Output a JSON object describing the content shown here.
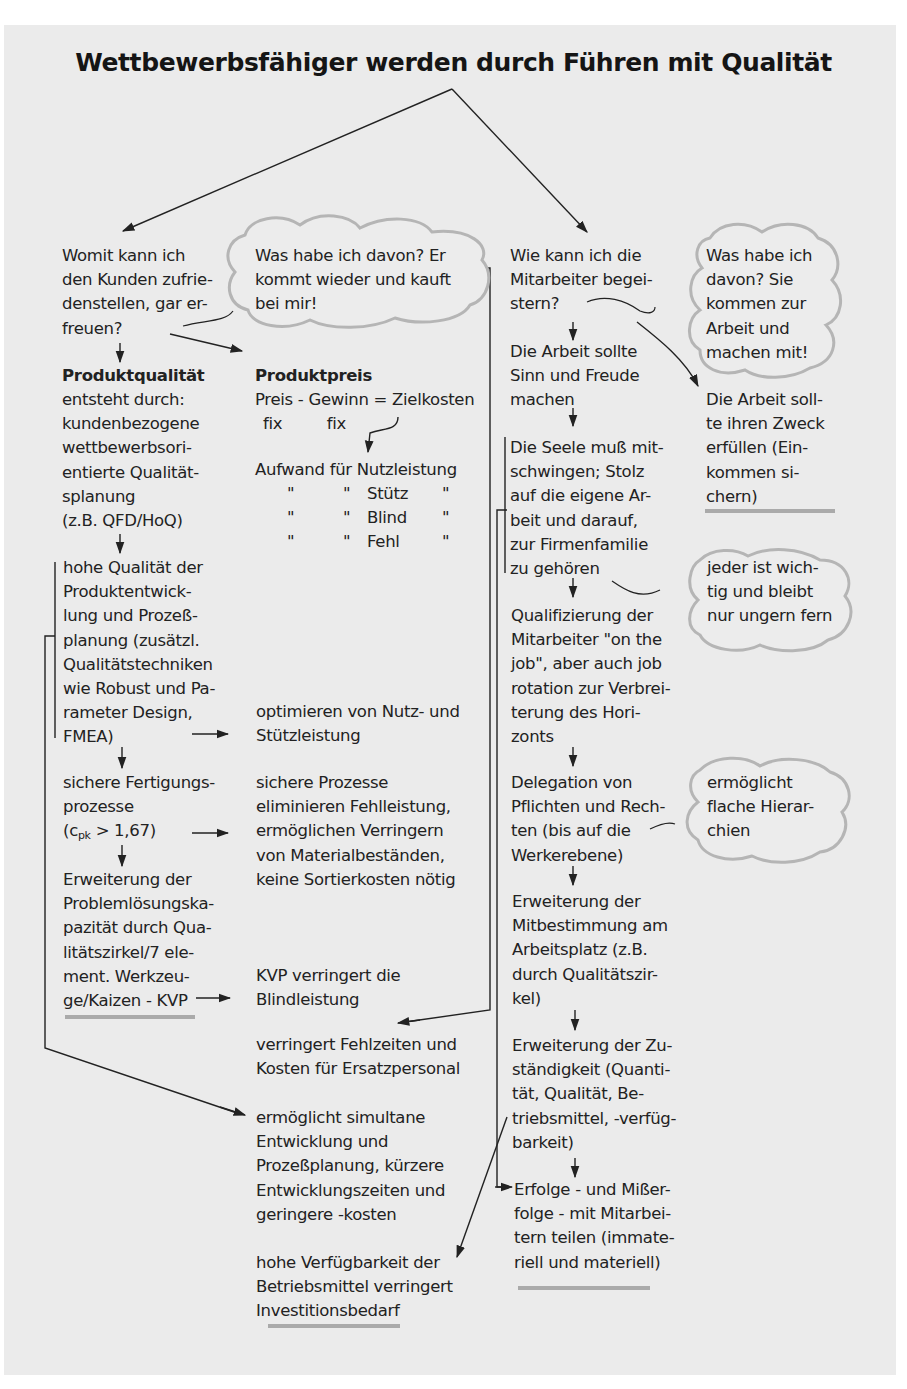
{
  "title": "Wettbewerbsfähiger werden durch Führen mit Qualität",
  "colors": {
    "background": "#ebebeb",
    "text": "#222222",
    "cloud_stroke": "#b5b5b5",
    "underline": "#aaaaaa"
  },
  "left_branch": {
    "question": "Womit kann ich\nden Kunden zufrie-\ndenstellen, gar er-\nfreuen?",
    "cloud": "Was habe ich davon? Er\nkommt wieder und kauft\nbei mir!",
    "produktqualitaet": {
      "heading": "Produktqualität",
      "text": "entsteht durch:\nkundenbezogene\nwettbewerbsori-\nentierte Qualität-\nsplanung\n(z.B. QFD/HoQ)"
    },
    "produktpreis": {
      "heading": "Produktpreis",
      "formula": "Preis - Gewinn = Zielkosten",
      "fix_labels": " fix         fix",
      "aufwand": "Aufwand für Nutzleistung",
      "rows": [
        {
          "col1": "\"",
          "col2": "\"",
          "word": "Stütz",
          "col4": "\""
        },
        {
          "col1": "\"",
          "col2": "\"",
          "word": "Blind",
          "col4": "\""
        },
        {
          "col1": "\"",
          "col2": "\"",
          "word": "Fehl",
          "col4": "\""
        }
      ]
    },
    "hohe_qualitaet": "hohe Qualität der\nProduktentwick-\nlung und Prozeß-\nplanung (zusätzl.\nQualitätstechniken\nwie Robust und Pa-\nrameter Design,\nFMEA)",
    "optimieren": "optimieren von Nutz- und\nStützleistung",
    "sichere_fertigung": {
      "line1": "sichere Fertigungs-",
      "line2": "prozesse",
      "cpk_pre": "(c",
      "cpk_sub": "pk",
      "cpk_post": " > 1,67)"
    },
    "sichere_prozesse": "sichere Prozesse\neliminieren Fehlleistung,\nermöglichen Verringern\nvon Materialbeständen,\nkeine Sortierkosten nötig",
    "erweiterung_problem": "Erweiterung der\nProblemlösungska-\npazität durch Qua-\nlitätszirkel/7 ele-\nment. Werkzeu-\nge/Kaizen - KVP",
    "kvp": "KVP verringert die\nBlindleistung",
    "fehlzeiten": "verringert Fehlzeiten und\nKosten für Ersatzpersonal",
    "simultane": "ermöglicht simultane\nEntwicklung und\nProzeßplanung, kürzere\nEntwicklungszeiten und\ngeringere -kosten",
    "verfuegbarkeit": "hohe Verfügbarkeit der\nBetriebsmittel verringert\nInvestitionsbedarf"
  },
  "right_branch": {
    "question": "Wie kann ich die\nMitarbeiter begei-\nstern?",
    "cloud": "Was habe ich\ndavon? Sie\nkommen zur\nArbeit und\nmachen mit!",
    "sinn": "Die Arbeit sollte\nSinn und Freude\nmachen",
    "zweck": "Die Arbeit soll-\nte ihren Zweck\nerfüllen (Ein-\nkommen si-\nchern)",
    "seele": "Die Seele muß mit-\nschwingen; Stolz\nauf die eigene Ar-\nbeit und darauf,\nzur Firmenfamilie\nzu gehören",
    "cloud_wichtig": "jeder ist wich-\ntig und bleibt\nnur ungern fern",
    "qualifizierung": "Qualifizierung der\nMitarbeiter \"on the\njob\", aber auch job\nrotation zur Verbrei-\nterung des Hori-\nzonts",
    "delegation": "Delegation von\nPflichten und Rech-\nten (bis auf die\nWerkerebene)",
    "cloud_flach": "ermöglicht\nflache Hierar-\nchien",
    "mitbestimmung": "Erweiterung der\nMitbestimmung am\nArbeitsplatz (z.B.\ndurch Qualitätszir-\nkel)",
    "zustaendigkeit": "Erweiterung der Zu-\nständigkeit (Quanti-\ntät, Qualität, Be-\ntriebsmittel, -verfüg-\nbarkeit)",
    "erfolge": "Erfolge - und Mißer-\nfolge - mit Mitarbei-\ntern teilen (immate-\nriell und materiell)"
  }
}
